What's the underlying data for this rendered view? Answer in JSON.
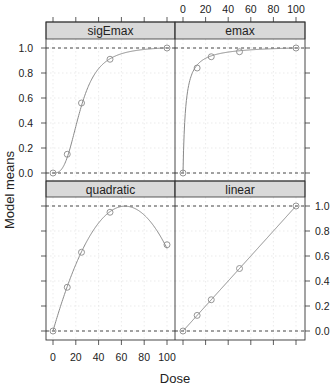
{
  "chart_data": {
    "type": "line",
    "layout": "2x2 trellis (lattice) panels",
    "ylabel": "Model means",
    "xlabel": "Dose",
    "x_ticks": [
      0,
      20,
      40,
      60,
      80,
      100
    ],
    "y_ticks": [
      0.0,
      0.2,
      0.4,
      0.6,
      0.8,
      1.0
    ],
    "y_tick_labels": [
      "0.0",
      "0.2",
      "0.4",
      "0.6",
      "0.8",
      "1.0"
    ],
    "xlim": [
      0,
      100
    ],
    "ylim": [
      0,
      1
    ],
    "reference_lines": [
      0.0,
      1.0
    ],
    "grid": true,
    "doses": [
      0,
      12.5,
      25,
      50,
      100
    ],
    "panels": [
      {
        "name": "sigEmax",
        "position": "top-left",
        "values": [
          0.0,
          0.15,
          0.56,
          0.91,
          1.0
        ]
      },
      {
        "name": "emax",
        "position": "top-right",
        "values": [
          0.0,
          0.84,
          0.93,
          0.97,
          1.0
        ]
      },
      {
        "name": "quadratic",
        "position": "bottom-left",
        "values": [
          0.0,
          0.35,
          0.63,
          0.95,
          0.69
        ]
      },
      {
        "name": "linear",
        "position": "bottom-right",
        "values": [
          0.0,
          0.125,
          0.25,
          0.5,
          1.0
        ]
      }
    ]
  },
  "panels": {
    "tl": {
      "title": "sigEmax"
    },
    "tr": {
      "title": "emax"
    },
    "bl": {
      "title": "quadratic"
    },
    "br": {
      "title": "linear"
    }
  },
  "axes": {
    "ylabel": "Model means",
    "xlabel": "Dose",
    "x": [
      "0",
      "20",
      "40",
      "60",
      "80",
      "100"
    ],
    "y": [
      "0.0",
      "0.2",
      "0.4",
      "0.6",
      "0.8",
      "1.0"
    ]
  },
  "colors": {
    "strip": "#d9d9d9",
    "curve": "#8a8a8a",
    "frame": "#333333",
    "grid": "#e2e2e2"
  }
}
